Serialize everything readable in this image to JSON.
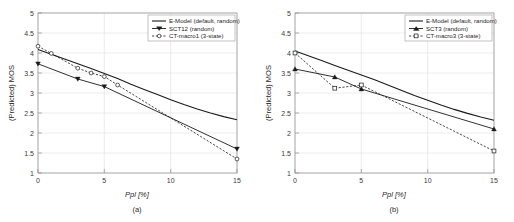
{
  "figure": {
    "background_color": "#ffffff",
    "line_color": "#1a1a1a",
    "grid_color": "#d8d8d8",
    "axis_color": "#8c8c8c"
  },
  "panels": [
    {
      "caption": "(a)",
      "id": "panel-a"
    },
    {
      "caption": "(b)",
      "id": "panel-b"
    }
  ],
  "chart_data": [
    {
      "type": "line",
      "title": "",
      "subtitle": "(a)",
      "xlabel": "Ppl [%]",
      "ylabel": "(Predicted) MOS",
      "xlim": [
        0,
        15
      ],
      "ylim": [
        1,
        5
      ],
      "xticks": [
        0,
        5,
        10,
        15
      ],
      "xticklabels": [
        "0",
        "5",
        "10",
        "15"
      ],
      "yticks": [
        1,
        1.5,
        2,
        2.5,
        3,
        3.5,
        4,
        4.5,
        5
      ],
      "yticklabels": [
        "1",
        "1.5",
        "2",
        "2.5",
        "3",
        "3.5",
        "4",
        "4.5",
        "5"
      ],
      "grid": true,
      "legend_position": "upper right",
      "series": [
        {
          "name": "E-Model (default, random)",
          "style": "solid",
          "marker": "none",
          "x": [
            0,
            1,
            2,
            3,
            4,
            5,
            6,
            7,
            8,
            9,
            10,
            11,
            12,
            13,
            14,
            15
          ],
          "y": [
            4.09,
            3.97,
            3.85,
            3.73,
            3.61,
            3.49,
            3.36,
            3.22,
            3.09,
            2.96,
            2.83,
            2.71,
            2.6,
            2.5,
            2.41,
            2.33
          ]
        },
        {
          "name": "SCT12 (random)",
          "style": "solid",
          "marker": "triangle-down",
          "x": [
            0,
            3,
            5,
            15
          ],
          "y": [
            3.73,
            3.35,
            3.16,
            1.6
          ]
        },
        {
          "name": "CT-macro1 (3-state)",
          "style": "dashed",
          "marker": "circle-open",
          "x": [
            0,
            1,
            3,
            4,
            5,
            6,
            15
          ],
          "y": [
            4.17,
            3.99,
            3.62,
            3.5,
            3.41,
            3.2,
            1.35
          ]
        }
      ]
    },
    {
      "type": "line",
      "title": "",
      "subtitle": "(b)",
      "xlabel": "Ppl [%]",
      "ylabel": "(Predicted) MOS",
      "xlim": [
        0,
        15
      ],
      "ylim": [
        1,
        5
      ],
      "xticks": [
        0,
        5,
        10,
        15
      ],
      "xticklabels": [
        "0",
        "5",
        "10",
        "15"
      ],
      "yticks": [
        1,
        1.5,
        2,
        2.5,
        3,
        3.5,
        4,
        4.5,
        5
      ],
      "yticklabels": [
        "1",
        "1.5",
        "2",
        "2.5",
        "3",
        "3.5",
        "4",
        "4.5",
        "5"
      ],
      "grid": true,
      "legend_position": "upper right",
      "series": [
        {
          "name": "E-Model (default, random)",
          "style": "solid",
          "marker": "none",
          "x": [
            0,
            1,
            2,
            3,
            4,
            5,
            6,
            7,
            8,
            9,
            10,
            11,
            12,
            13,
            14,
            15
          ],
          "y": [
            4.05,
            3.93,
            3.81,
            3.69,
            3.57,
            3.45,
            3.33,
            3.2,
            3.07,
            2.94,
            2.82,
            2.7,
            2.59,
            2.49,
            2.4,
            2.32
          ]
        },
        {
          "name": "SCT3 (random)",
          "style": "solid",
          "marker": "triangle-up",
          "x": [
            0,
            3,
            5,
            15
          ],
          "y": [
            3.6,
            3.4,
            3.1,
            2.1
          ]
        },
        {
          "name": "CT-macro3 (3-state)",
          "style": "dashed",
          "marker": "square-open",
          "x": [
            0,
            3,
            5,
            15
          ],
          "y": [
            4.0,
            3.12,
            3.2,
            1.55
          ]
        }
      ]
    }
  ]
}
